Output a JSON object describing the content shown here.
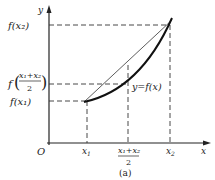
{
  "figure": {
    "caption": "(a)",
    "origin_label": "O",
    "x_axis_label": "x",
    "y_axis_label": "y",
    "curve_label": "y=f(x)",
    "x_ticks": [
      "x1",
      "(x1+x2)/2",
      "x2"
    ],
    "y_ticks": [
      "f(x2)",
      "f((x1+x2)/2)",
      "f(x1)"
    ],
    "labels": {
      "x1": "x",
      "x1_sub": "1",
      "x2": "x",
      "x2_sub": "2",
      "mid_num": "x₁+x₂",
      "mid_den": "2",
      "fx2": "f(x₂)",
      "fx1": "f(x₁)",
      "fmid_f": "f",
      "fmid_num": "x₁+x₂",
      "fmid_den": "2"
    },
    "colors": {
      "line": "#222222",
      "dashed": "#333333"
    }
  }
}
